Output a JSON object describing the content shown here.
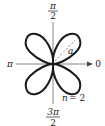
{
  "diagram": {
    "type": "polar-rose",
    "equation_label": "n = 2",
    "n_text": "n",
    "equals_two_text": "= 2",
    "petal_length_label": "a",
    "axis_labels": {
      "top_num": "π",
      "top_den": "2",
      "left": "π",
      "right": "0",
      "bottom_num": "3π",
      "bottom_den": "2"
    },
    "colors": {
      "curve": "#1a1a1a",
      "axes": "#555555",
      "dashed": "#888888"
    }
  }
}
